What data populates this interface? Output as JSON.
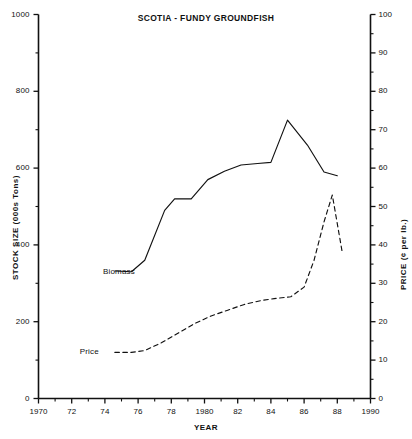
{
  "chart_data": {
    "type": "line",
    "title": "SCOTIA - FUNDY GROUNDFISH",
    "xlabel": "YEAR",
    "ylabel": "STOCK SIZE (000s Tons)",
    "y2label": "PRICE (¢ per lb.)",
    "grid": false,
    "legend_position": "inline-annotation",
    "xlim": [
      1970,
      1990
    ],
    "ylim": [
      0,
      1000
    ],
    "y2lim": [
      0,
      100
    ],
    "x_ticks": [
      1970,
      1972,
      1974,
      1976,
      1978,
      1980,
      1982,
      1984,
      1986,
      1988,
      1990
    ],
    "x_tick_labels": [
      "1970",
      "72",
      "74",
      "76",
      "78",
      "1980",
      "82",
      "84",
      "86",
      "88",
      "1990"
    ],
    "x_minor_ticks": [
      1971,
      1973,
      1975,
      1977,
      1979,
      1981,
      1983,
      1985,
      1987,
      1989
    ],
    "y_ticks": [
      0,
      200,
      400,
      600,
      800,
      1000
    ],
    "y_tick_labels": [
      "0",
      "200",
      "400",
      "600",
      "800",
      "1000"
    ],
    "y_minor_ticks": [
      100,
      300,
      500,
      700,
      900
    ],
    "y2_ticks": [
      0,
      10,
      20,
      30,
      40,
      50,
      60,
      70,
      80,
      90,
      100
    ],
    "y2_tick_labels": [
      "0",
      "10",
      "20",
      "30",
      "40",
      "50",
      "60",
      "70",
      "80",
      "90",
      "100"
    ],
    "y2_minor_ticks": [
      5,
      15,
      25,
      35,
      45,
      55,
      65,
      75,
      85,
      95
    ],
    "series": [
      {
        "name": "Biomass",
        "axis": "left",
        "style": "solid",
        "color": "#111111",
        "label_x": 1974.0,
        "label_y": 330,
        "x": [
          1974.6,
          1975.6,
          1976.4,
          1977.6,
          1978.2,
          1979.2,
          1980.2,
          1981.2,
          1982.2,
          1983.2,
          1984.0,
          1985.0,
          1986.2,
          1987.2,
          1988.0
        ],
        "values": [
          332,
          330,
          360,
          490,
          520,
          520,
          570,
          592,
          608,
          612,
          615,
          725,
          660,
          590,
          580
        ]
      },
      {
        "name": "Price",
        "axis": "right",
        "style": "dashed",
        "color": "#111111",
        "label_x": 1972.6,
        "label_y": 12,
        "x": [
          1974.6,
          1975.6,
          1976.4,
          1977.4,
          1978.4,
          1979.4,
          1980.4,
          1981.4,
          1982.4,
          1983.4,
          1984.2,
          1985.2,
          1986.0,
          1986.6,
          1987.2,
          1987.7,
          1988.3
        ],
        "values": [
          12,
          12,
          12.5,
          14.5,
          17,
          19.5,
          21.5,
          23,
          24.5,
          25.5,
          26,
          26.5,
          29,
          36,
          46,
          53,
          38
        ]
      }
    ],
    "annotations": [
      {
        "text": "Biomass",
        "x": 1974.0,
        "y": 330
      },
      {
        "text": "Price",
        "x": 1972.6,
        "y": 12
      }
    ]
  }
}
